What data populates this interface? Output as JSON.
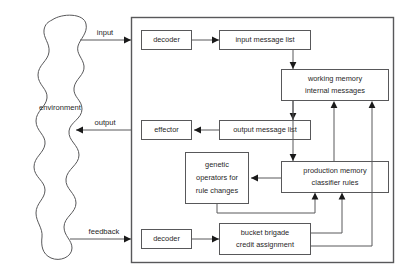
{
  "diagram": {
    "colors": {
      "stroke": "#58585a",
      "arrow_fill": "#1a1a1a",
      "text": "#1f1f1f",
      "background": "#ffffff"
    },
    "environment": {
      "label": "environment"
    },
    "edge_labels": {
      "input": "input",
      "output": "output",
      "feedback": "feedback"
    },
    "boxes": [
      {
        "id": "input-decoder",
        "label": "decoder"
      },
      {
        "id": "input-message-list",
        "label": "input message list"
      },
      {
        "id": "working-memory",
        "line1": "working memory",
        "line2": "internal messages"
      },
      {
        "id": "effector",
        "label": "effector"
      },
      {
        "id": "output-message-list",
        "label": "output message list"
      },
      {
        "id": "genetic-operators",
        "line1": "genetic",
        "line2": "operators for",
        "line3": "rule changes"
      },
      {
        "id": "production-memory",
        "line1": "production memory",
        "line2": "classifier rules"
      },
      {
        "id": "feedback-decoder",
        "label": "decoder"
      },
      {
        "id": "bucket-brigade",
        "line1": "bucket brigade",
        "line2": "credit assignment"
      }
    ]
  }
}
